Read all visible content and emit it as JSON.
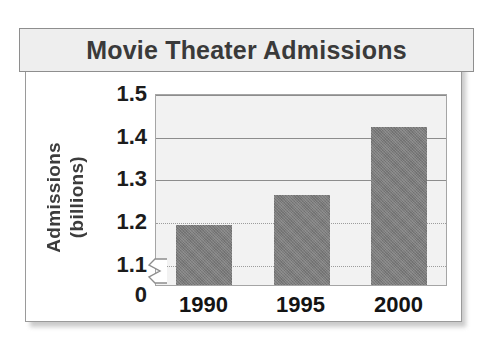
{
  "chart_data": {
    "type": "bar",
    "title": "Movie Theater Admissions",
    "xlabel": "",
    "ylabel": "Admissions (billions)",
    "ylabel_lines": [
      "Admissions",
      "(billions)"
    ],
    "categories": [
      "1990",
      "1995",
      "2000"
    ],
    "values": [
      1.19,
      1.26,
      1.42
    ],
    "ytick_labels": [
      "1.5",
      "1.4",
      "1.3",
      "1.2",
      "1.1",
      "0"
    ],
    "ytick_values": [
      1.5,
      1.4,
      1.3,
      1.2,
      1.1,
      0
    ],
    "ylim": [
      1.05,
      1.5
    ],
    "y_axis_break": true,
    "y_axis_break_below": 1.1,
    "grid": true,
    "grid_axis": "y",
    "legend": false,
    "legend_position": "none",
    "bar_color": "#7b7b7b",
    "plot_background": "#f2f2f2",
    "title_band_color": "#eeeeee",
    "title_text_color": "#3a3a3a",
    "frame_color": "#9a9a9a",
    "grid_color": "#8d8d8d"
  }
}
